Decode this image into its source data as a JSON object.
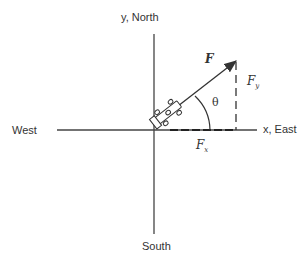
{
  "labels": {
    "y_axis": "y, North",
    "x_axis": "x, East",
    "west": "West",
    "south": "South",
    "force": "F",
    "fy": "F",
    "fy_sub": "y",
    "fx": "F",
    "fx_sub": "x",
    "angle": "θ"
  },
  "colors": {
    "line": "#333333",
    "background": "#ffffff"
  }
}
